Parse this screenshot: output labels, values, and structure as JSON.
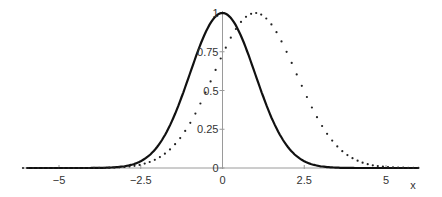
{
  "chart_data": {
    "type": "line",
    "title": "",
    "xlabel": "x",
    "ylabel": "",
    "xlim": [
      -6.1,
      6.0
    ],
    "ylim": [
      0,
      1
    ],
    "grid": false,
    "legend": null,
    "x_ticks": [
      -5,
      -2.5,
      0,
      2.5,
      5
    ],
    "x_tick_labels": [
      "−5",
      "−2.5",
      "0",
      "2.5",
      "5"
    ],
    "y_ticks": [
      0,
      0.25,
      0.5,
      0.75,
      1
    ],
    "y_tick_labels": [
      "0",
      "0.25",
      "0.5",
      "0.75",
      "1"
    ],
    "series": [
      {
        "name": "solid curve",
        "style": "solid",
        "color": "#111111",
        "description": "Gaussian centered at 0, peak 1",
        "x": [
          -6,
          -5,
          -4,
          -3,
          -2.5,
          -2,
          -1.5,
          -1,
          -0.5,
          0,
          0.5,
          1,
          1.5,
          2,
          2.5,
          3,
          4,
          5
        ],
        "values": [
          0,
          0,
          0,
          0.01,
          0.04,
          0.14,
          0.32,
          0.61,
          0.88,
          1,
          0.88,
          0.61,
          0.32,
          0.14,
          0.04,
          0.01,
          0,
          0
        ]
      },
      {
        "name": "dotted curve",
        "style": "dotted",
        "color": "#222222",
        "description": "Wider Gaussian centered at 1, peak 1",
        "x": [
          -6,
          -5,
          -4,
          -3,
          -2.5,
          -2,
          -1.5,
          -1,
          -0.5,
          0,
          0.5,
          1,
          1.5,
          2,
          2.5,
          3,
          3.5,
          4,
          5,
          6
        ],
        "values": [
          0,
          0,
          0,
          0.01,
          0.02,
          0.06,
          0.14,
          0.29,
          0.5,
          0.73,
          0.92,
          1,
          0.92,
          0.73,
          0.5,
          0.29,
          0.14,
          0.06,
          0.01,
          0
        ]
      }
    ]
  },
  "axis": {
    "x_label": "x"
  }
}
